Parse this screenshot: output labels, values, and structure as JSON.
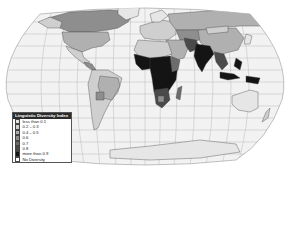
{
  "map": {
    "projection": "robinson",
    "ocean_color": "#f2f2f2",
    "graticule_color": "#b5b5b5",
    "border_color": "#444444"
  },
  "legend": {
    "title": "Linguistic Diversity Index",
    "items": [
      {
        "label": "less than 0.1",
        "color": "#e6e6e6"
      },
      {
        "label": "0.2 – 0.3",
        "color": "#cfcfcf"
      },
      {
        "label": "0.4 – 0.5",
        "color": "#b0b0b0"
      },
      {
        "label": "0.6",
        "color": "#8e8e8e"
      },
      {
        "label": "0.7",
        "color": "#6c6c6c"
      },
      {
        "label": "0.8",
        "color": "#4a4a4a"
      },
      {
        "label": "more than 0.9",
        "color": "#141414"
      },
      {
        "label": "No Diversity",
        "color": "#ffffff"
      }
    ]
  }
}
